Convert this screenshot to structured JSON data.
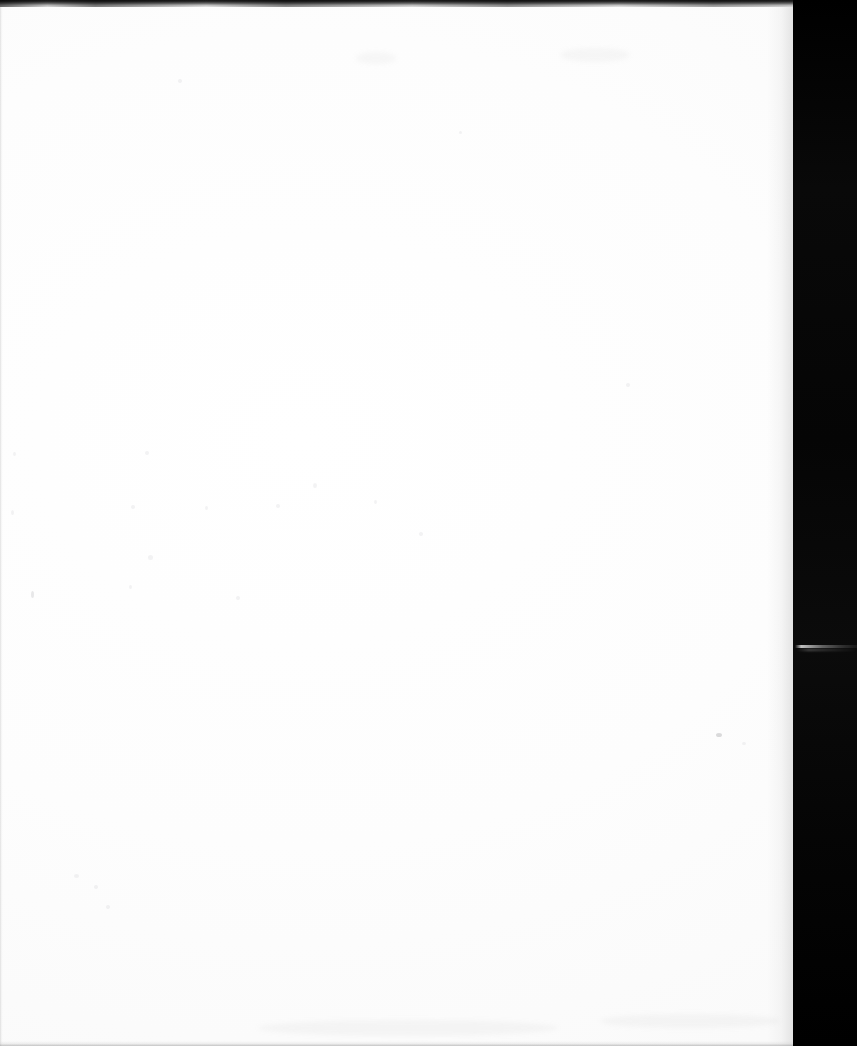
{
  "document": {
    "kind": "scanned-page",
    "page_state": "blank",
    "visible_text": "",
    "ghost_text": {
      "line_a": "",
      "line_b": "",
      "line_c": "",
      "note": ""
    }
  },
  "colors": {
    "page_white": "#fefefe",
    "paper_tint": "#fafafa",
    "scanner_black": "#050505",
    "top_edge_dark": "#141414",
    "streak_gray": "#d2d2d2",
    "speck_gray": "#78787d"
  },
  "geometry": {
    "canvas_width": "857",
    "canvas_height": "1046",
    "page_width": "793",
    "page_height": "1046",
    "scanner_bar_left": "793",
    "top_edge_height": "7",
    "streak_y": "645"
  },
  "artifacts": {
    "top_edge_label": "",
    "bottom_edge_label": "",
    "streak_label": "",
    "backdrop_label": ""
  }
}
